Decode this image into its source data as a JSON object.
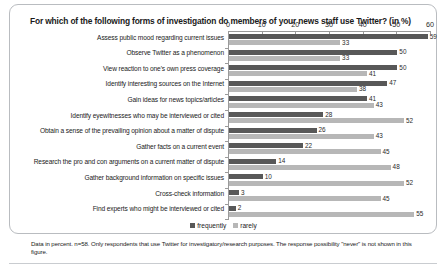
{
  "figure": {
    "title": "For which of the following forms of investigation do members of your news staff use Twitter? (in %)",
    "footnote": "Data in percent. n=58. Only respondents that use Twitter for investigatory/research purposes. The response possibility \"never\" is not shown in this figure.",
    "colors": {
      "frequently": "#585858",
      "rarely": "#b7b7b7",
      "border": "#b9bcc0",
      "axis": "#9a9a9a"
    }
  },
  "chart_data": {
    "type": "bar",
    "orientation": "horizontal",
    "title": "For which of the following forms of investigation do members of your news staff use Twitter? (in %)",
    "xlabel": "",
    "ylabel": "",
    "xlim": [
      0,
      60
    ],
    "xticks": [
      0,
      10,
      20,
      30,
      40,
      50,
      60
    ],
    "grid": false,
    "legend_position": "bottom",
    "categories": [
      "Assess public mood regarding current issues",
      "Observe Twitter as a phenomenon",
      "View reaction to one's own press coverage",
      "Identify interesting sources on the Internet",
      "Gain ideas for news topics/articles",
      "Identify eyewitnesses who may be interviewed or cited",
      "Obtain a sense of the prevailing opinion about a matter of dispute",
      "Gather facts on a current event",
      "Research the pro and con arguments on a current matter of dispute",
      "Gather background information on specific issues",
      "Cross-check information",
      "Find experts who might be interviewed or cited"
    ],
    "series": [
      {
        "name": "frequently",
        "color": "#585858",
        "values": [
          59,
          50,
          50,
          47,
          41,
          28,
          26,
          22,
          14,
          10,
          3,
          2
        ]
      },
      {
        "name": "rarely",
        "color": "#b7b7b7",
        "values": [
          33,
          33,
          41,
          38,
          43,
          52,
          43,
          45,
          48,
          52,
          45,
          55
        ]
      }
    ]
  },
  "legend": {
    "items": [
      {
        "label": "frequently"
      },
      {
        "label": "rarely"
      }
    ]
  }
}
